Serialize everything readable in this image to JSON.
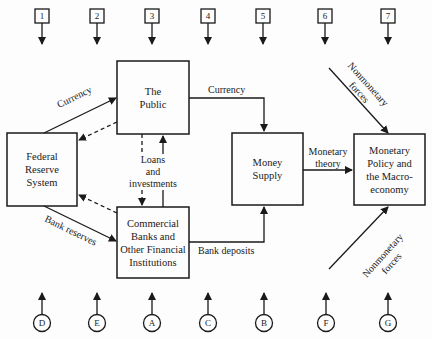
{
  "top_markers": [
    "1",
    "2",
    "3",
    "4",
    "5",
    "6",
    "7"
  ],
  "bottom_markers": [
    "D",
    "E",
    "A",
    "C",
    "B",
    "F",
    "G"
  ],
  "boxes": {
    "public": "The\nPublic",
    "fed": "Federal\nReserve\nSystem",
    "banks": "Commercial\nBanks and\nOther Financial\nInstitutions",
    "money_supply": "Money\nSupply",
    "macro": "Monetary\nPolicy and\nthe Macro-\neconomy"
  },
  "labels": {
    "currency_fed_public": "Currency",
    "currency_public_supply": "Currency",
    "loans": "Loans\nand\ninvestments",
    "bank_reserves": "Bank reserves",
    "bank_deposits": "Bank deposits",
    "monetary_theory": "Monetary\ntheory",
    "nonmonetary_top": "Nonmonetary\nforces",
    "nonmonetary_bottom": "Nonmonetary\nforces"
  }
}
